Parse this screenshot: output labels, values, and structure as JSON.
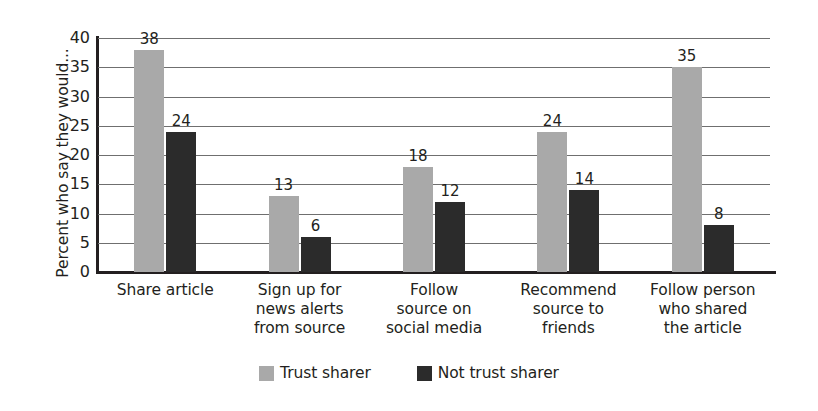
{
  "chart_data": {
    "type": "bar",
    "title": "",
    "xlabel": "",
    "ylabel": "Percent who say they would...",
    "ylim": [
      0,
      40
    ],
    "ytick_step": 5,
    "yticks": [
      "40",
      "35",
      "30",
      "25",
      "20",
      "15",
      "10",
      "5",
      "0"
    ],
    "grid": true,
    "legend_position": "bottom-center",
    "categories": [
      "Share article",
      "Sign up for\nnews alerts\nfrom source",
      "Follow\nsource on\nsocial media",
      "Recommend\nsource to\nfriends",
      "Follow person\nwho shared\nthe article"
    ],
    "category_lines": [
      [
        "Share article"
      ],
      [
        "Sign up for",
        "news alerts",
        "from source"
      ],
      [
        "Follow",
        "source on",
        "social media"
      ],
      [
        "Recommend",
        "source to",
        "friends"
      ],
      [
        "Follow person",
        "who shared",
        "the article"
      ]
    ],
    "series": [
      {
        "name": "Trust sharer",
        "color": "#a9a9a9",
        "values": [
          38,
          13,
          18,
          24,
          35
        ]
      },
      {
        "name": "Not trust sharer",
        "color": "#2b2b2b",
        "values": [
          24,
          6,
          12,
          14,
          8
        ]
      }
    ]
  },
  "legend": {
    "items": [
      {
        "label": "Trust sharer",
        "swatch": "trust"
      },
      {
        "label": "Not trust sharer",
        "swatch": "not-trust"
      }
    ]
  },
  "colors": {
    "trust_sharer": "#a9a9a9",
    "not_trust_sharer": "#2b2b2b",
    "axis": "#231f20",
    "gridline": "#6f6f6f",
    "background": "#ffffff"
  }
}
